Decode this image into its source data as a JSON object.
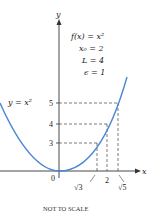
{
  "diagram": {
    "annotations": {
      "function": "f(x) = x²",
      "x0": "x₀ = 2",
      "L": "L = 4",
      "epsilon": "ϵ = 1"
    },
    "curve_label": "y = x²",
    "axes": {
      "x_label": "x",
      "y_label": "y",
      "origin_label": "0"
    },
    "y_ticks": [
      "5",
      "4",
      "3"
    ],
    "x_ticks": [
      "√3",
      "2",
      "√5"
    ],
    "footer_note": "NOT TO SCALE",
    "colors": {
      "curve": "#4a86d4",
      "axes": "#333333",
      "dashed": "#444444"
    }
  }
}
